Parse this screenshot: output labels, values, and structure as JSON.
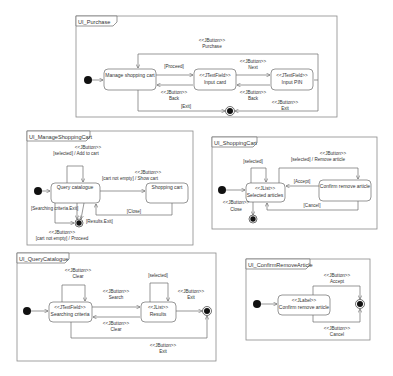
{
  "diagrams": {
    "purchase": {
      "title": "UI_Purchase",
      "states": {
        "manage": "Manage shopping cart",
        "card_stereo": "<<JTextField>>",
        "card": "Input card",
        "pin_stereo": "<<JTextField>>",
        "pin": "Input PIN"
      },
      "transitions": {
        "purchase_stereo": "<<JButton>>",
        "purchase": "Purchase",
        "proceed": "[Proceed]",
        "next_stereo": "<<JButton>>",
        "next": "Next",
        "back1_stereo": "<<JButton>>",
        "back1": "Back",
        "back2_stereo": "<<JButton>>",
        "back2": "Back",
        "exit_guard": "[Exit]",
        "exit_stereo": "<<JButton>>",
        "exit": "Exit"
      }
    },
    "manage_cart": {
      "title": "UI_ManageShoppingCart",
      "states": {
        "query": "Query catalogue",
        "cart": "Shopping cart"
      },
      "transitions": {
        "add_stereo": "<<JButton>>",
        "add": "[selected] / Add to cart",
        "show_stereo": "<<JButton>>",
        "show": "[cart not empty] / Show cart",
        "close": "[Close]",
        "search_exit": "[Searching criteria.Exit]",
        "results_exit": "[Results.Exit]",
        "proceed_stereo": "<<JButton>>",
        "proceed": "[cart not empty] / Proceed"
      }
    },
    "shopping_cart": {
      "title": "UI_ShoppingCart",
      "states": {
        "selected_stereo": "<<JList>>",
        "selected": "Selected articles",
        "confirm": "Confirm remove article"
      },
      "transitions": {
        "selected_guard": "[selected]",
        "remove_stereo": "<<JButton>>",
        "remove": "[selected] / Remove article",
        "accept": "[Accept]",
        "cancel": "[Cancel]",
        "close_stereo": "<<JButton>>",
        "close": "Close"
      }
    },
    "query_catalogue": {
      "title": "UI_QueryCatalogue",
      "states": {
        "criteria_stereo": "<<JTextField>>",
        "criteria": "Searching criteria",
        "results_stereo": "<<JList>>",
        "results": "Results"
      },
      "transitions": {
        "clear1_stereo": "<<JButton>>",
        "clear1": "Clear",
        "search_stereo": "<<JButton>>",
        "search": "Search",
        "selected": "[selected]",
        "exit1_stereo": "<<JButton>>",
        "exit1": "Exit",
        "clear2_stereo": "<<JButton>>",
        "clear2": "Clear",
        "exit2_stereo": "<<JButton>>",
        "exit2": "Exit"
      }
    },
    "confirm_remove": {
      "title": "UI_ConfirmRemoveArticle",
      "states": {
        "confirm_stereo": "<<JLabel>>",
        "confirm": "Confirm remove article"
      },
      "transitions": {
        "accept_stereo": "<<JButton>>",
        "accept": "Accept",
        "cancel_stereo": "<<JButton>>",
        "cancel": "Cancel"
      }
    }
  }
}
